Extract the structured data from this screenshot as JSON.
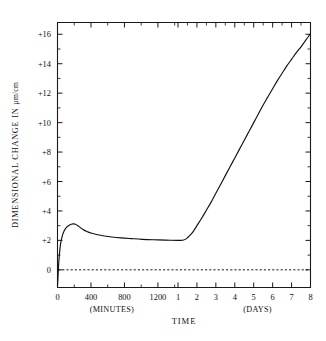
{
  "chart_data": {
    "type": "line",
    "title": "",
    "xlabel": "TIME",
    "ylabel": "DIMENSIONAL CHANGE IN",
    "ylabel_unit": "µm/cm",
    "grid": false,
    "legend": null,
    "ylim": [
      -1.2,
      16.8
    ],
    "y_ticks_major": [
      0,
      2,
      4,
      6,
      8,
      10,
      12,
      14,
      16
    ],
    "y_tick_labels": [
      "0",
      "+2",
      "+4",
      "+6",
      "+8",
      "+10",
      "+12",
      "+14",
      "+16"
    ],
    "y_minor_count_between": 1,
    "x_axis_note": "Dual piecewise scale: minutes segment 0-1440 min then days segment 1-8 days",
    "x_tick_labels_minutes": [
      "0",
      "400",
      "800",
      "1200"
    ],
    "x_tick_values_minutes": [
      0,
      400,
      800,
      1200
    ],
    "x_tick_labels_days": [
      "1",
      "2",
      "3",
      "4",
      "5",
      "6",
      "7",
      "8"
    ],
    "x_tick_values_days": [
      1,
      2,
      3,
      4,
      5,
      6,
      7,
      8
    ],
    "x_subcaption_left": "(MINUTES)",
    "x_subcaption_right": "(DAYS)",
    "zero_reference_line": 0,
    "zero_reference_style": "dashed",
    "series": [
      {
        "name": "dimensional change",
        "units": "µm/cm",
        "points_minutes": [
          [
            0,
            -1.1
          ],
          [
            5,
            -0.6
          ],
          [
            12,
            0.2
          ],
          [
            22,
            1.0
          ],
          [
            35,
            1.7
          ],
          [
            55,
            2.25
          ],
          [
            80,
            2.65
          ],
          [
            110,
            2.9
          ],
          [
            145,
            3.05
          ],
          [
            185,
            3.12
          ],
          [
            215,
            3.1
          ],
          [
            255,
            2.95
          ],
          [
            300,
            2.75
          ],
          [
            350,
            2.6
          ],
          [
            410,
            2.48
          ],
          [
            480,
            2.38
          ],
          [
            560,
            2.3
          ],
          [
            650,
            2.23
          ],
          [
            760,
            2.17
          ],
          [
            880,
            2.12
          ],
          [
            1010,
            2.07
          ],
          [
            1150,
            2.04
          ],
          [
            1290,
            2.02
          ],
          [
            1440,
            2.0
          ]
        ],
        "points_days": [
          [
            1.0,
            2.0
          ],
          [
            1.15,
            2.0
          ],
          [
            1.3,
            2.03
          ],
          [
            1.45,
            2.12
          ],
          [
            1.6,
            2.3
          ],
          [
            1.8,
            2.6
          ],
          [
            2.0,
            3.0
          ],
          [
            2.25,
            3.5
          ],
          [
            2.5,
            4.05
          ],
          [
            2.75,
            4.6
          ],
          [
            3.0,
            5.2
          ],
          [
            3.25,
            5.8
          ],
          [
            3.5,
            6.4
          ],
          [
            3.75,
            7.0
          ],
          [
            4.0,
            7.6
          ],
          [
            4.25,
            8.2
          ],
          [
            4.5,
            8.8
          ],
          [
            4.75,
            9.4
          ],
          [
            5.0,
            10.0
          ],
          [
            5.25,
            10.6
          ],
          [
            5.5,
            11.2
          ],
          [
            5.75,
            11.75
          ],
          [
            6.0,
            12.3
          ],
          [
            6.25,
            12.85
          ],
          [
            6.5,
            13.35
          ],
          [
            6.75,
            13.85
          ],
          [
            7.0,
            14.3
          ],
          [
            7.25,
            14.75
          ],
          [
            7.5,
            15.15
          ],
          [
            7.75,
            15.6
          ],
          [
            8.0,
            16.05
          ]
        ],
        "annotations": [
          {
            "label": "initial contraction",
            "value": -1.1
          },
          {
            "label": "early expansion peak",
            "value": 3.12
          },
          {
            "label": "plateau",
            "value": 2.0
          },
          {
            "label": "final value at 8 days",
            "value": 16.05
          }
        ]
      }
    ]
  },
  "figure": {
    "background_color": "#ffffff",
    "line_color": "#111111",
    "axis_color": "#1a1a1a"
  }
}
